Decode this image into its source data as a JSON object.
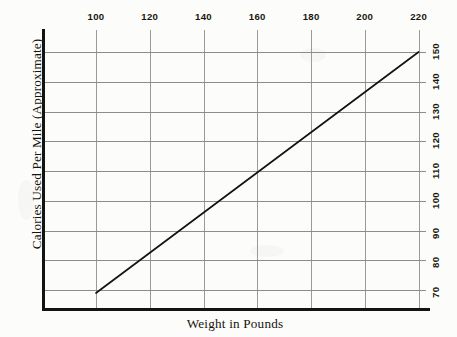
{
  "chart_data": {
    "type": "line",
    "title": "",
    "xlabel": "Weight in Pounds",
    "ylabel": "Calories Used Per Mile (Approximate)",
    "xlim": [
      90,
      230
    ],
    "ylim": [
      65,
      155
    ],
    "x_axis_position": "top",
    "y_axis_position": "right",
    "grid": true,
    "legend": null,
    "x_ticks": [
      100,
      120,
      140,
      160,
      180,
      200,
      220
    ],
    "x_tick_labels": [
      "100",
      "120",
      "140",
      "160",
      "180",
      "200",
      "220"
    ],
    "y_ticks": [
      70,
      80,
      90,
      100,
      110,
      120,
      130,
      140,
      150
    ],
    "y_tick_labels": [
      "70",
      "80",
      "90",
      "100",
      "110",
      "120",
      "130",
      "140",
      "150"
    ],
    "series": [
      {
        "name": "Calories used per mile",
        "x": [
          100,
          220
        ],
        "values": [
          69,
          150
        ],
        "color": "#14130f",
        "line_width": 1.7
      }
    ],
    "points": [
      {
        "x": 100,
        "y": 69
      },
      {
        "x": 120,
        "y": 82
      },
      {
        "x": 140,
        "y": 96
      },
      {
        "x": 160,
        "y": 109
      },
      {
        "x": 180,
        "y": 123
      },
      {
        "x": 200,
        "y": 136
      },
      {
        "x": 220,
        "y": 150
      }
    ],
    "colors": {
      "background": "#fcfcfa",
      "axis": "#14130f",
      "grid": "#8d8d88",
      "text": "#15140f",
      "line": "#14130f"
    }
  }
}
